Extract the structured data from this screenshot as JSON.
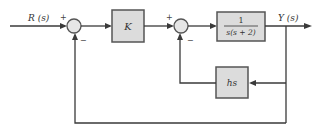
{
  "figure": {
    "type": "feedback block diagram",
    "input_label": "R (s)",
    "output_label": "Y (s)",
    "summing_junctions": [
      {
        "id": "sum1",
        "signs": {
          "left": "+",
          "bottom": "−"
        },
        "plus_label": "+",
        "minus_label": "−"
      },
      {
        "id": "sum2",
        "signs": {
          "left": "+",
          "bottom": "−"
        },
        "plus_label": "+",
        "minus_label": "−"
      }
    ],
    "blocks": {
      "gain": {
        "label": "K"
      },
      "plant": {
        "numerator": "1",
        "denominator": "s(s + 2)"
      },
      "rate_feedback": {
        "label": "hs"
      }
    },
    "colors": {
      "block_fill": "#dcdcdc",
      "block_border": "#555555",
      "wire": "#3a3a3a",
      "background": "#ffffff"
    }
  }
}
